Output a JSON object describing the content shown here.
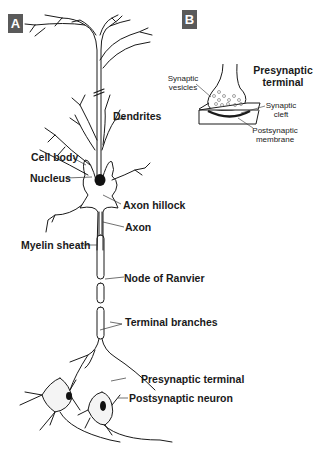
{
  "panels": {
    "a": {
      "tag": "A"
    },
    "b": {
      "tag": "B"
    }
  },
  "neuron_labels": {
    "dendrites": "Dendrites",
    "cell_body": "Cell body",
    "nucleus": "Nucleus",
    "axon_hillock": "Axon hillock",
    "axon": "Axon",
    "myelin_sheath": "Myelin sheath",
    "node_of_ranvier": "Node of Ranvier",
    "terminal_branches": "Terminal branches",
    "presynaptic_terminal": "Presynaptic terminal",
    "postsynaptic_neuron": "Postsynaptic neuron"
  },
  "synapse_labels": {
    "title_line1": "Presynaptic",
    "title_line2": "terminal",
    "vesicles_line1": "Synaptic",
    "vesicles_line2": "vesicles",
    "cleft_line1": "Synaptic",
    "cleft_line2": "cleft",
    "membrane_line1": "Postsynaptic",
    "membrane_line2": "membrane"
  },
  "colors": {
    "tag_bg": "#5a5a5a",
    "line": "#1a1a1a",
    "nucleus": "#111111"
  }
}
